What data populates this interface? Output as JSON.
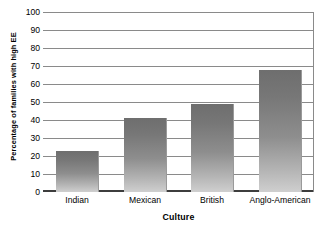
{
  "chart_data": {
    "type": "bar",
    "title": "",
    "subtitle": "",
    "xlabel": "Culture",
    "ylabel": "Percentage of families with high EE",
    "categories": [
      "Indian",
      "Mexican",
      "British",
      "Anglo-American"
    ],
    "values": [
      23,
      41,
      49,
      68
    ],
    "series": [
      {
        "name": "Percentage of families with high EE",
        "values": [
          23,
          41,
          49,
          68
        ]
      }
    ],
    "ylim": [
      0,
      100
    ],
    "yticks": [
      0,
      10,
      20,
      30,
      40,
      50,
      60,
      70,
      80,
      90,
      100
    ],
    "ytick_labels": [
      "0",
      "10",
      "20",
      "30",
      "40",
      "50",
      "60",
      "70",
      "80",
      "90",
      "100"
    ],
    "grid": true,
    "grid_axis": "y",
    "legend": false,
    "legend_position": "none",
    "annotations": [],
    "colors": {
      "bar_top": "#6e6e6e",
      "bar_bottom": "#cfcfcf",
      "gridline": "#8a8a8a",
      "baseline": "#3d3d3d",
      "text": "#000000",
      "background": "#ffffff"
    }
  }
}
